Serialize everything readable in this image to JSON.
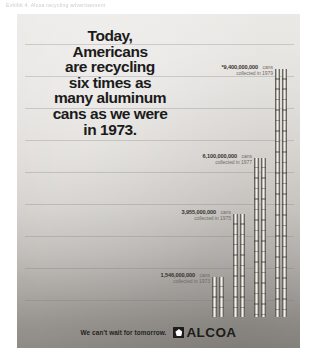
{
  "page": {
    "caption": "Exhibit 4.  Alcoa recycling advertisement"
  },
  "ad": {
    "headline_lines": [
      "Today,",
      "Americans",
      "are recycling",
      "six times as",
      "many aluminum",
      "cans as we were",
      "in 1973."
    ],
    "footer": {
      "tagline": "We can't wait for tomorrow.",
      "brand": "ALCOA",
      "logo_mark": "alcoa-pentagon-icon"
    },
    "colors": {
      "background_top": "#ebe9e6",
      "background_bottom": "#8e8b86",
      "headline_text": "#1b1b1b",
      "label_text": "#6e6b67",
      "can_highlight": "#f2f0ec",
      "can_shadow": "#4f4c47"
    }
  },
  "chart_data": {
    "type": "bar",
    "xlabel": "",
    "ylabel": "Cans collected",
    "ylim": [
      0,
      9400000000
    ],
    "grid": true,
    "legend": null,
    "categories": [
      "1973",
      "1975",
      "1977",
      "1979"
    ],
    "values": [
      1546000000,
      3955000000,
      6100000000,
      9400000000
    ],
    "bars": [
      {
        "year": "1973",
        "value": 1546000000,
        "amount_label": "1,546,000,000",
        "unit_label": "cans",
        "sub_label": "collected in 1973",
        "footnote_marker": "",
        "height_px": 40,
        "left_px": 195
      },
      {
        "year": "1975",
        "value": 3955000000,
        "amount_label": "3,955,000,000",
        "unit_label": "cans",
        "sub_label": "collected in 1975",
        "footnote_marker": "",
        "height_px": 103,
        "left_px": 216
      },
      {
        "year": "1977",
        "value": 6100000000,
        "amount_label": "6,100,000,000",
        "unit_label": "cans",
        "sub_label": "collected in 1977",
        "footnote_marker": "",
        "height_px": 159,
        "left_px": 237
      },
      {
        "year": "1979",
        "value": 9400000000,
        "amount_label": "9,400,000,000",
        "unit_label": "cans",
        "sub_label": "collected in 1979",
        "footnote_marker": "*",
        "height_px": 248,
        "left_px": 258
      }
    ],
    "gridline_y_px": [
      30,
      62,
      94,
      126,
      158,
      190,
      222,
      254,
      286
    ]
  }
}
